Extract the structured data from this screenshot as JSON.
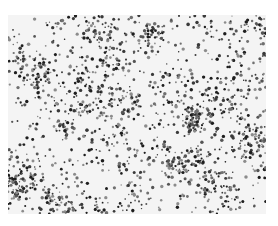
{
  "image": {
    "description": "grayscale micrograph of densely scattered dark particles on a light background",
    "background_color": "#f4f4f4",
    "dot_colors": [
      "#1e1e1e",
      "#3a3a3a",
      "#555555",
      "#707070",
      "#8c8c8c"
    ],
    "region": {
      "x": 8,
      "y": 15,
      "width": 258,
      "height": 199
    },
    "dot_count": 1700,
    "cluster_count": 40,
    "seed": 17
  }
}
